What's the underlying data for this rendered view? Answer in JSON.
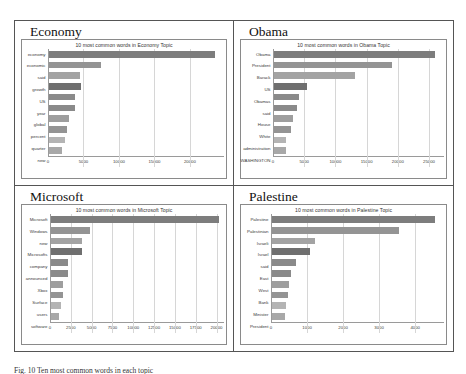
{
  "caption": "Fig. 10 Ten most common words in each topic",
  "colors": {
    "bar": "#8e8e8e",
    "bar_dark": "#6f6f6f",
    "bar_light": "#b4b4b4",
    "axis": "#8a8a8a",
    "grid": "#d6d6d6",
    "frame": "#555555"
  },
  "panels": [
    {
      "title": "Economy",
      "position": "top-left",
      "label_width": 26
    },
    {
      "title": "Obama",
      "position": "top-right",
      "label_width": 32
    },
    {
      "title": "Microsoft",
      "position": "bottom-left",
      "label_width": 28
    },
    {
      "title": "Palestine",
      "position": "bottom-right",
      "label_width": 30
    }
  ],
  "chart_data": [
    {
      "type": "bar",
      "orientation": "horizontal",
      "title": "10 most common words in Economy Topic",
      "xlabel": "",
      "ylabel": "",
      "categories": [
        "economy",
        "economic",
        "said",
        "growth",
        "US",
        "year",
        "global",
        "percent",
        "quarter",
        "new"
      ],
      "values": [
        23500,
        7300,
        4400,
        4500,
        3700,
        3700,
        2900,
        2600,
        2200,
        1900
      ],
      "xticks": [
        0,
        5000,
        10000,
        15000,
        20000
      ],
      "xticklabels": [
        "0",
        "5000",
        "10000",
        "15000",
        "20000"
      ],
      "xlim": [
        0,
        24800
      ],
      "grid": true,
      "legend": "none"
    },
    {
      "type": "bar",
      "orientation": "horizontal",
      "title": "10 most common words in Obama Topic",
      "xlabel": "",
      "ylabel": "",
      "categories": [
        "Obama",
        "President",
        "Barack",
        "US",
        "Obamas",
        "said",
        "House",
        "White",
        "administration",
        "WASHINGTON"
      ],
      "values": [
        26000,
        19000,
        13000,
        5300,
        4100,
        3700,
        3000,
        2800,
        2000,
        1900
      ],
      "xticks": [
        0,
        5000,
        10000,
        15000,
        20000,
        25000
      ],
      "xticklabels": [
        "0",
        "5000",
        "10000",
        "15000",
        "20000",
        "25000"
      ],
      "xlim": [
        0,
        27400
      ],
      "grid": true,
      "legend": "none"
    },
    {
      "type": "bar",
      "orientation": "horizontal",
      "title": "10 most common words in Microsoft Topic",
      "xlabel": "",
      "ylabel": "",
      "categories": [
        "Microsoft",
        "Windows",
        "new",
        "Microsofts",
        "company",
        "announced",
        "Xbox",
        "Surface",
        "users",
        "software"
      ],
      "values": [
        20300,
        4700,
        3800,
        3700,
        2100,
        2100,
        1400,
        1400,
        1200,
        1000
      ],
      "xticks": [
        0,
        2500,
        5000,
        7500,
        10000,
        12500,
        15000,
        17500,
        20000
      ],
      "xticklabels": [
        "0",
        "2500",
        "5000",
        "7500",
        "10000",
        "12500",
        "15000",
        "17500",
        "20000"
      ],
      "xlim": [
        0,
        20900
      ],
      "grid": true,
      "legend": "none"
    },
    {
      "type": "bar",
      "orientation": "horizontal",
      "title": "10 most common words in Palestine Topic",
      "xlabel": "",
      "ylabel": "",
      "categories": [
        "Palestine",
        "Palestinian",
        "Israeli",
        "Israel",
        "said",
        "East",
        "West",
        "Bank",
        "Minister",
        "President"
      ],
      "values": [
        4550,
        3550,
        1200,
        1070,
        680,
        530,
        480,
        440,
        390,
        360
      ],
      "xticks": [
        0,
        1000,
        2000,
        3000,
        4000
      ],
      "xticklabels": [
        "0",
        "1000",
        "2000",
        "3000",
        "4000"
      ],
      "xlim": [
        0,
        4800
      ],
      "grid": true,
      "legend": "none"
    }
  ]
}
